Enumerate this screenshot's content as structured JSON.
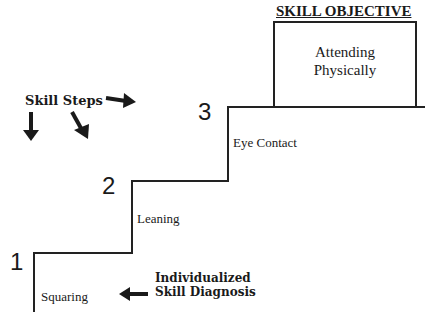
{
  "objective": {
    "title": "SKILL OBJECTIVE",
    "line1": "Attending",
    "line2": "Physically"
  },
  "skill_steps_label": "Skill Steps",
  "steps": [
    {
      "number": "1",
      "label": "Squaring"
    },
    {
      "number": "2",
      "label": "Leaning"
    },
    {
      "number": "3",
      "label": "Eye Contact"
    }
  ],
  "diagnosis": {
    "line1": "Individualized",
    "line2": "Skill Diagnosis"
  },
  "colors": {
    "line": "#222222",
    "text": "#1a1a1a",
    "background": "#ffffff"
  }
}
